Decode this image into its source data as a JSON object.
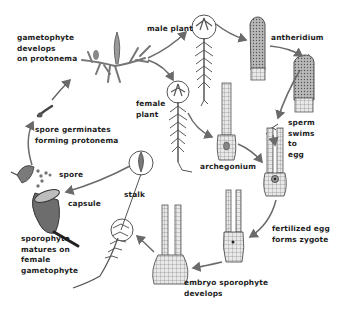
{
  "diagram": {
    "labels": {
      "gametophyte_develops": "gametophyte\ndevelops\non protonema",
      "male_plant": "male plant",
      "antheridium": "antheridium",
      "female_plant": "female\nplant",
      "sperm_swims": "sperm\nswims\nto\negg",
      "archegonium": "archegonium",
      "spore_germinates": "spore germinates\nforming protonema",
      "spore": "spore",
      "capsule": "capsule",
      "stalk": "stalk",
      "sporophyte_matures": "sporophyte\nmatures on\nfemale\ngametophyte",
      "fertilized_egg": "fertilized egg\nforms zygote",
      "embryo_sporophyte": "embryo sporophyte\ndevelops"
    },
    "colors": {
      "ink": "#1c1c1c",
      "arrow": "#6a6a6a",
      "plant": "#5a5a5a",
      "cell": "#8a8a8a"
    }
  }
}
